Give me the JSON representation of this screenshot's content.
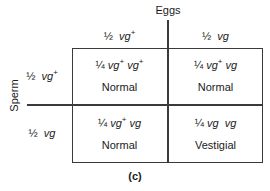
{
  "figure": {
    "caption": "(c)",
    "axes": {
      "columns_axis_label": "Eggs",
      "rows_axis_label": "Sperm"
    },
    "colors": {
      "background": "#ffffff",
      "line": "#3a3a3a",
      "text": "#1a1a1a"
    }
  },
  "punnett": {
    "column_headers": [
      {
        "fraction": "½",
        "gene": "vg",
        "superscript": "+"
      },
      {
        "fraction": "½",
        "gene": "vg",
        "superscript": ""
      }
    ],
    "row_headers": [
      {
        "fraction": "½",
        "gene": "vg",
        "superscript": "+"
      },
      {
        "fraction": "½",
        "gene": "vg",
        "superscript": ""
      }
    ],
    "cells": [
      {
        "fraction": "¼",
        "allele1": "vg",
        "sup1": "+",
        "allele2": "vg",
        "sup2": "+",
        "phenotype": "Normal"
      },
      {
        "fraction": "¼",
        "allele1": "vg",
        "sup1": "+",
        "allele2": "vg",
        "sup2": "",
        "phenotype": "Normal"
      },
      {
        "fraction": "¼",
        "allele1": "vg",
        "sup1": "+",
        "allele2": "vg",
        "sup2": "",
        "phenotype": "Normal"
      },
      {
        "fraction": "¼",
        "allele1": "vg",
        "sup1": "",
        "allele2": "vg",
        "sup2": "",
        "phenotype": "Vestigial"
      }
    ]
  }
}
